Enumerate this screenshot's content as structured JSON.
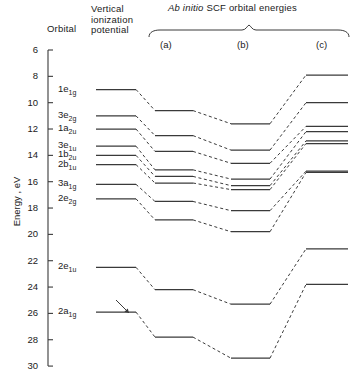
{
  "figure": {
    "headers": {
      "orbital": "Orbital",
      "vip": "Vertical\nionization\npotential",
      "abinitio_pre": "Ab initio",
      "abinitio_post": " SCF orbital energies",
      "col_a": "(a)",
      "col_b": "(b)",
      "col_c": "(c)"
    },
    "axis": {
      "label": "Energy , eV",
      "min": 6,
      "max": 30,
      "ticks": [
        6,
        8,
        10,
        12,
        14,
        16,
        18,
        20,
        22,
        24,
        26,
        28,
        30
      ],
      "direction": "inverted"
    },
    "colors": {
      "line": "#3a3a3a",
      "axis": "#1a1a1a",
      "text": "#1a1a1a"
    }
  },
  "chart_data": {
    "type": "line",
    "title": "Ab initio SCF orbital energies",
    "xlabel": "",
    "ylabel": "Energy , eV",
    "ylim": [
      30,
      6
    ],
    "grid": false,
    "legend": "none",
    "columns": [
      "Vertical ionization potential",
      "(a)",
      "(b)",
      "(c)"
    ],
    "series": [
      {
        "name": "1e1g",
        "label_html": "1e<sub>1g</sub>",
        "values": [
          9.0,
          10.6,
          11.6,
          7.9
        ]
      },
      {
        "name": "3e2g",
        "label_html": "3e<sub>2g</sub>",
        "values": [
          11.0,
          12.5,
          13.6,
          10.0
        ]
      },
      {
        "name": "1a2u",
        "label_html": "1a<sub>2u</sub>",
        "values": [
          12.0,
          13.7,
          14.6,
          11.8
        ]
      },
      {
        "name": "3e1u",
        "label_html": "3e<sub>1u</sub>",
        "values": [
          13.3,
          15.1,
          15.8,
          12.2
        ]
      },
      {
        "name": "1b2u",
        "label_html": "1b<sub>2u</sub>",
        "values": [
          14.0,
          15.6,
          16.3,
          12.9
        ]
      },
      {
        "name": "2b1u",
        "label_html": "2b<sub>1u</sub>",
        "values": [
          14.7,
          16.1,
          16.6,
          13.1
        ]
      },
      {
        "name": "3a1g",
        "label_html": "3a<sub>1g</sub>",
        "values": [
          16.2,
          17.5,
          18.2,
          15.2
        ]
      },
      {
        "name": "2e2g",
        "label_html": "2e<sub>2g</sub>",
        "values": [
          17.3,
          18.9,
          19.8,
          15.3
        ]
      },
      {
        "name": "2e1u",
        "label_html": "2e<sub>1u</sub>",
        "values": [
          22.5,
          24.2,
          25.3,
          21.1
        ]
      },
      {
        "name": "2a1g",
        "label_html": "2a<sub>1g</sub>",
        "values": [
          25.9,
          27.8,
          29.4,
          23.8
        ]
      }
    ],
    "annotations": [
      {
        "type": "arrow",
        "near": "2a1g",
        "note": "uncertainty arrow on vertical ionization potential"
      }
    ]
  }
}
